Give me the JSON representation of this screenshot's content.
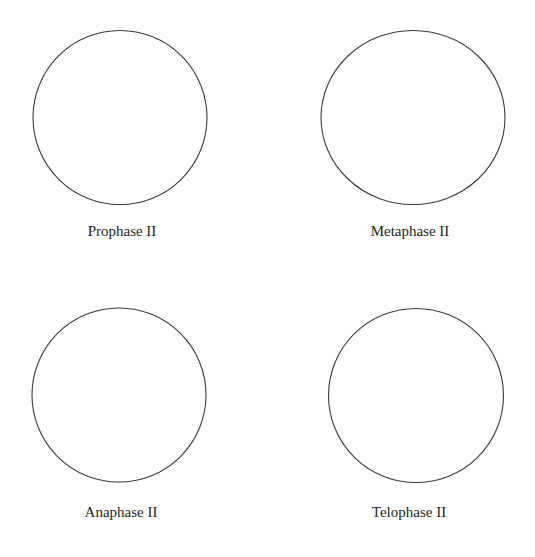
{
  "diagram": {
    "stroke_color": "#3a3a3a",
    "background": "#ffffff",
    "cells": [
      {
        "id": "prophase-ii",
        "label": "Prophase II",
        "cx": 120,
        "cy": 117.5,
        "rx": 87,
        "ry": 87,
        "label_x": 122,
        "label_y": 224
      },
      {
        "id": "metaphase-ii",
        "label": "Metaphase II",
        "cx": 413,
        "cy": 117.5,
        "rx": 92,
        "ry": 87,
        "label_x": 410,
        "label_y": 224
      },
      {
        "id": "anaphase-ii",
        "label": "Anaphase II",
        "cx": 119,
        "cy": 395,
        "rx": 87,
        "ry": 87,
        "label_x": 121,
        "label_y": 505
      },
      {
        "id": "telophase-ii",
        "label": "Telophase II",
        "cx": 416,
        "cy": 395.5,
        "rx": 87.5,
        "ry": 87,
        "label_x": 409,
        "label_y": 505
      }
    ]
  }
}
